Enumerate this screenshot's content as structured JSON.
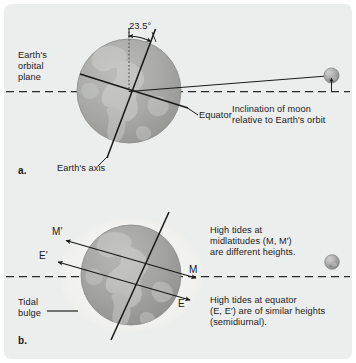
{
  "figure": {
    "background_color": "#eceded",
    "page_color": "#ffffff",
    "globe_color": "#a8a9a8",
    "bulge_color": "#f2f2f0",
    "line_color": "#1a1a1a",
    "moon_color": "#9a9b9a"
  },
  "panel_a": {
    "key": "a.",
    "orbital_plane_label": "Earth's\norbital\nplane",
    "orbital_plane_line1": "Earth's",
    "orbital_plane_line2": "orbital",
    "orbital_plane_line3": "plane",
    "tilt_angle": "23.5°",
    "equator_label": "Equator",
    "axis_label": "Earth's axis",
    "moon_inclination_line1": "Inclination of moon",
    "moon_inclination_line2": "relative to Earth's orbit",
    "moon_icon": "moon-sphere",
    "axis_tilt_degrees": 23.5
  },
  "panel_b": {
    "key": "b.",
    "tidal_bulge_line1": "Tidal",
    "tidal_bulge_line2": "bulge",
    "point_m_prime": "M′",
    "point_m": "M",
    "point_e_prime": "E′",
    "point_e": "E",
    "note_mid_line1": "High tides at",
    "note_mid_line2": "midlatitudes (M, M′)",
    "note_mid_line3": "are different heights.",
    "note_eq_line1": "High tides at equator",
    "note_eq_line2": "(E, E′) are of similar heights",
    "note_eq_line3": "(semidiurnal).",
    "moon_icon": "moon-sphere"
  }
}
